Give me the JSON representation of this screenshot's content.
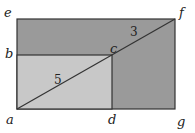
{
  "diagram": {
    "points": {
      "a": "a",
      "b": "b",
      "c": "c",
      "d": "d",
      "e": "e",
      "f": "f",
      "g": "g"
    },
    "lengths": {
      "ac": "5",
      "cf": "3"
    },
    "colors": {
      "outer_fill": "#9a9a9a",
      "inner_fill": "#c8c8c8",
      "stroke": "#333333"
    }
  }
}
